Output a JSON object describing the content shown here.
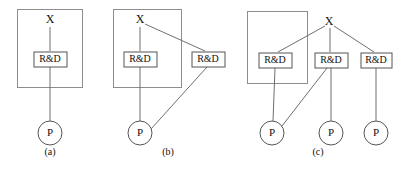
{
  "figure": {
    "background_color": "#ffffff",
    "line_color": "#6f6f6f",
    "box_stroke_color": "#555555",
    "group_stroke_color": "#8d8d8d",
    "text_color": "#111111",
    "panels": [
      {
        "id": "a",
        "caption": "(a)",
        "caption_x": 50,
        "caption_y": 153,
        "group_box": {
          "x": 17,
          "y": 9,
          "width": 65,
          "height": 78
        },
        "nodes": [
          {
            "id": "a-x",
            "type": "text",
            "label": "X",
            "x": 50,
            "y": 20
          },
          {
            "id": "a-rd",
            "type": "box",
            "label": "R&D",
            "x": 50,
            "y": 59,
            "width": 33,
            "height": 15
          },
          {
            "id": "a-p",
            "type": "circle",
            "label": "P",
            "x": 50,
            "y": 133,
            "r": 12
          }
        ],
        "edges": [
          {
            "from": "a-x",
            "to": "a-rd",
            "x1": 50,
            "y1": 27,
            "x2": 50,
            "y2": 51
          },
          {
            "from": "a-rd",
            "to": "a-p",
            "x1": 50,
            "y1": 67,
            "x2": 50,
            "y2": 121
          }
        ]
      },
      {
        "id": "b",
        "caption": "(b)",
        "caption_x": 168,
        "caption_y": 153,
        "group_box": {
          "x": 113,
          "y": 9,
          "width": 68,
          "height": 78
        },
        "nodes": [
          {
            "id": "b-x",
            "type": "text",
            "label": "X",
            "x": 140,
            "y": 20
          },
          {
            "id": "b-rd1",
            "type": "box",
            "label": "R&D",
            "x": 140,
            "y": 59,
            "width": 33,
            "height": 15
          },
          {
            "id": "b-rd2",
            "type": "box",
            "label": "R&D",
            "x": 208,
            "y": 59,
            "width": 33,
            "height": 15
          },
          {
            "id": "b-p",
            "type": "circle",
            "label": "P",
            "x": 140,
            "y": 133,
            "r": 12
          }
        ],
        "edges": [
          {
            "from": "b-x",
            "to": "b-rd1",
            "x1": 140,
            "y1": 27,
            "x2": 140,
            "y2": 51
          },
          {
            "from": "b-x",
            "to": "b-rd2",
            "x1": 145,
            "y1": 24,
            "x2": 205,
            "y2": 51
          },
          {
            "from": "b-rd1",
            "to": "b-p",
            "x1": 140,
            "y1": 67,
            "x2": 140,
            "y2": 121
          },
          {
            "from": "b-rd2",
            "to": "b-p",
            "x1": 207,
            "y1": 67,
            "x2": 151,
            "y2": 129
          }
        ]
      },
      {
        "id": "c",
        "caption": "(c)",
        "caption_x": 318,
        "caption_y": 153,
        "group_box": {
          "x": 247,
          "y": 11,
          "width": 60,
          "height": 72
        },
        "nodes": [
          {
            "id": "c-x",
            "type": "text",
            "label": "X",
            "x": 329,
            "y": 22
          },
          {
            "id": "c-rd1",
            "type": "box",
            "label": "R&D",
            "x": 275,
            "y": 60,
            "width": 33,
            "height": 15
          },
          {
            "id": "c-rd2",
            "type": "box",
            "label": "R&D",
            "x": 331,
            "y": 60,
            "width": 33,
            "height": 15
          },
          {
            "id": "c-rd3",
            "type": "box",
            "label": "R&D",
            "x": 376,
            "y": 60,
            "width": 31,
            "height": 15
          },
          {
            "id": "c-p1",
            "type": "circle",
            "label": "P",
            "x": 272,
            "y": 133,
            "r": 12
          },
          {
            "id": "c-p2",
            "type": "circle",
            "label": "P",
            "x": 331,
            "y": 133,
            "r": 12
          },
          {
            "id": "c-p3",
            "type": "circle",
            "label": "P",
            "x": 376,
            "y": 133,
            "r": 12
          }
        ],
        "edges": [
          {
            "from": "c-x",
            "to": "c-rd1",
            "x1": 325,
            "y1": 26,
            "x2": 278,
            "y2": 52
          },
          {
            "from": "c-x",
            "to": "c-rd2",
            "x1": 330,
            "y1": 28,
            "x2": 330,
            "y2": 52
          },
          {
            "from": "c-x",
            "to": "c-rd3",
            "x1": 334,
            "y1": 26,
            "x2": 374,
            "y2": 52
          },
          {
            "from": "c-rd1",
            "to": "c-p1",
            "x1": 275,
            "y1": 68,
            "x2": 273,
            "y2": 121
          },
          {
            "from": "c-rd2",
            "to": "c-p1",
            "x1": 327,
            "y1": 68,
            "x2": 282,
            "y2": 126
          },
          {
            "from": "c-rd2",
            "to": "c-p2",
            "x1": 331,
            "y1": 68,
            "x2": 331,
            "y2": 121
          },
          {
            "from": "c-rd3",
            "to": "c-p3",
            "x1": 376,
            "y1": 68,
            "x2": 376,
            "y2": 121
          }
        ]
      }
    ]
  }
}
